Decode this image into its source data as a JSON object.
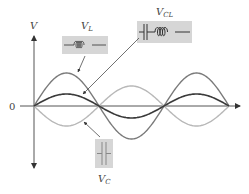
{
  "axes": {
    "y_label": "V",
    "zero_label": "0",
    "origin": [
      34,
      106
    ],
    "x_axis": {
      "x_start": 20,
      "x_end": 240
    },
    "y_axis": {
      "y_top": 34,
      "y_bottom": 170
    }
  },
  "waves": [
    {
      "name": "V_L",
      "color": "#7a7a7a",
      "amplitude": 33,
      "phase": 0,
      "stroke_width": 1.4
    },
    {
      "name": "V_C",
      "color": "#b8b8b8",
      "amplitude": -20,
      "phase": 0,
      "stroke_width": 1.4
    },
    {
      "name": "V_CL",
      "color": "#3a3a3a",
      "amplitude": 12,
      "phase": 0,
      "stroke_width": 1.6
    }
  ],
  "wave_params": {
    "x0": 34,
    "x_end": 229,
    "period": 130,
    "baseline": 106
  },
  "labels": {
    "vl": {
      "main": "V",
      "sub": "L"
    },
    "vcl": {
      "main": "V",
      "sub": "CL"
    },
    "vc": {
      "main": "V",
      "sub": "C"
    }
  },
  "component_boxes": {
    "inductor": {
      "icon": "inductor-coil-icon",
      "fill": "#d6d6d6"
    },
    "capacitor_inductor": {
      "icon": "capacitor-inductor-series-icon",
      "fill": "#d6d6d6"
    },
    "capacitor": {
      "icon": "capacitor-icon",
      "fill": "#d6d6d6"
    }
  }
}
